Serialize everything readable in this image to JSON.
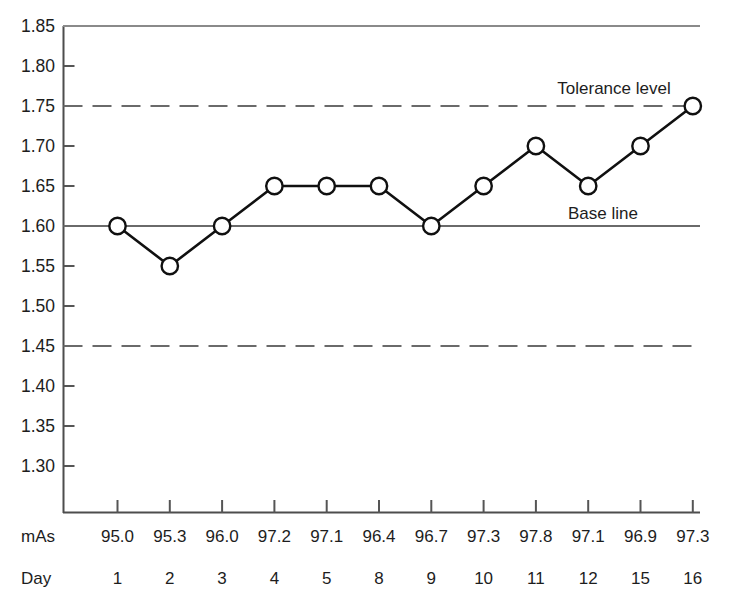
{
  "chart_data": {
    "type": "line",
    "title": "",
    "subtitle": "",
    "xlabel": "Day",
    "ylabel": "",
    "ylim": [
      1.275,
      1.85
    ],
    "yticks": [
      "1.85",
      "1.80",
      "1.75",
      "1.70",
      "1.65",
      "1.60",
      "1.55",
      "1.50",
      "1.45",
      "1.40",
      "1.35",
      "1.30"
    ],
    "ytick_values": [
      1.85,
      1.8,
      1.75,
      1.7,
      1.65,
      1.6,
      1.55,
      1.5,
      1.45,
      1.4,
      1.35,
      1.3
    ],
    "grid": false,
    "legend": "none",
    "categories": [
      "1",
      "2",
      "3",
      "4",
      "5",
      "8",
      "9",
      "10",
      "11",
      "12",
      "15",
      "16"
    ],
    "values": [
      1.6,
      1.55,
      1.6,
      1.65,
      1.65,
      1.65,
      1.6,
      1.65,
      1.7,
      1.65,
      1.7,
      1.75
    ],
    "series": [
      {
        "name": "Optical density",
        "values": [
          1.6,
          1.55,
          1.6,
          1.65,
          1.65,
          1.65,
          1.6,
          1.65,
          1.7,
          1.65,
          1.7,
          1.75
        ],
        "marker": "open-circle",
        "color": "#101010"
      }
    ],
    "reference_lines": [
      {
        "name": "tolerance-upper",
        "value": 1.75,
        "style": "dashed",
        "label": "Tolerance level"
      },
      {
        "name": "base-line",
        "value": 1.6,
        "style": "solid",
        "label": "Base line"
      },
      {
        "name": "tolerance-lower",
        "value": 1.45,
        "style": "dashed",
        "label": ""
      }
    ],
    "annotations": [
      {
        "name": "tolerance-level-annotation",
        "text": "Tolerance level",
        "value": 1.75
      },
      {
        "name": "base-line-annotation",
        "text": "Base line",
        "value": 1.6
      }
    ],
    "data_table": {
      "row_headers": [
        "mAs",
        "Day"
      ],
      "rows": [
        {
          "label": "mAs",
          "values": [
            "95.0",
            "95.3",
            "96.0",
            "97.2",
            "97.1",
            "96.4",
            "96.7",
            "97.3",
            "97.8",
            "97.1",
            "96.9",
            "97.3"
          ]
        },
        {
          "label": "Day",
          "values": [
            "1",
            "2",
            "3",
            "4",
            "5",
            "8",
            "9",
            "10",
            "11",
            "12",
            "15",
            "16"
          ]
        }
      ]
    },
    "colors": {
      "axis": "#555555",
      "series": "#101010",
      "reference": "#6a6a6a",
      "text": "#1d1d1d",
      "background": "#ffffff"
    }
  }
}
